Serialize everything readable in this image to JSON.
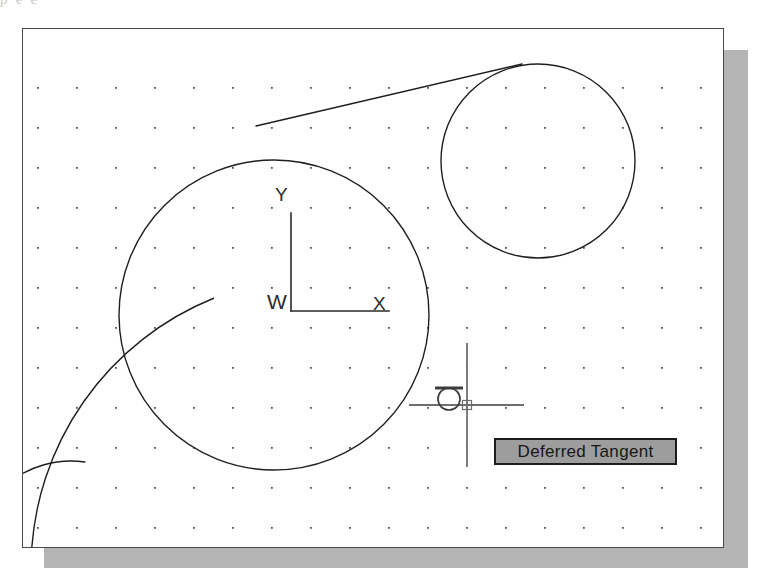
{
  "application": {
    "name": "CAD Drawing Editor",
    "scan_top_text_fragment": "p                                                                           e          e"
  },
  "drawing_area": {
    "background_color": "#ffffff",
    "border_color": "#4a4a4a",
    "shadow_color": "#b4b4b4",
    "bounds": {
      "x": 22,
      "y": 28,
      "width": 700,
      "height": 518
    }
  },
  "grid": {
    "visible": true,
    "dot_color": "#555555",
    "origin_x": 15,
    "origin_y": 59,
    "spacing_x": 39,
    "spacing_y": 40,
    "columns": 18,
    "rows": 12
  },
  "ucs_icon": {
    "type": "world-coordinate-system",
    "origin_x": 268,
    "origin_y": 282,
    "axis_length": 98,
    "label_y": "Y",
    "label_x": "X",
    "label_world": "W",
    "color": "#2a2a2a"
  },
  "geometry": {
    "stroke_color": "#1f1f1f",
    "stroke_width": 1.4,
    "entities": [
      {
        "name": "large-center-circle",
        "type": "circle",
        "cx": 251,
        "cy": 286,
        "r": 155
      },
      {
        "name": "upper-right-circle",
        "type": "circle",
        "cx": 515,
        "cy": 132,
        "r": 97
      },
      {
        "name": "tangent-line",
        "type": "line",
        "x1": 233,
        "y1": 97,
        "x2": 499,
        "y2": 35
      },
      {
        "name": "left-large-arc",
        "type": "arc",
        "cx": 300,
        "cy": 540,
        "r": 292,
        "start_angle": 182,
        "end_angle": 248
      },
      {
        "name": "bottom-left-arc",
        "type": "arc",
        "cx": 48,
        "cy": 532,
        "r": 100,
        "start_angle": 176,
        "end_angle": 278
      }
    ]
  },
  "cursor": {
    "type": "crosshair",
    "color": "#6e6e6e",
    "center_x": 444,
    "center_y": 376,
    "vertical_top": 314,
    "vertical_bottom": 438,
    "horizontal_left": 386,
    "horizontal_right": 501,
    "pickbox_size": 9
  },
  "osnap_marker": {
    "type": "tangent",
    "label": "Deferred Tangent",
    "marker_cx": 426,
    "marker_cy": 370,
    "marker_r": 11,
    "bar_width": 28,
    "color": "#3c3c3c"
  },
  "tooltip": {
    "text": "Deferred Tangent",
    "background_color": "#9d9d9d",
    "border_color": "#1c1c1c",
    "text_color": "#171717"
  }
}
